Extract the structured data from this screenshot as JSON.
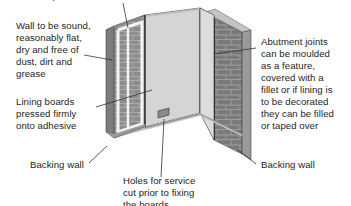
{
  "diagram": {
    "title_partial": "Dabs of adhesive",
    "labels": {
      "top_cutoff": "Strips of wall adhesive",
      "wall_condition": "Wall to be sound,\nreasonably flat,\ndry and free of\ndust, dirt and\ngrease",
      "lining_boards": "Lining boards\npressed firmly\nonto adhesive",
      "backing_wall_left": "Backing wall",
      "holes": "Holes for service\ncut prior to fixing\nthe boards",
      "abutment": "Abutment joints\ncan be moulded\nas a feature,\ncovered with a\nfillet or if lining is\nto be decorated\nthey can be filled\nor taped over",
      "backing_wall_right": "Backing wall"
    },
    "colors": {
      "brick": "#8c8c8c",
      "brick_dark": "#6e6e6e",
      "board": "#d9d9d9",
      "board_light": "#e4e4e4",
      "adhesive": "#f4f4f4",
      "floor": "#ffffff",
      "leader": "#333333"
    }
  }
}
